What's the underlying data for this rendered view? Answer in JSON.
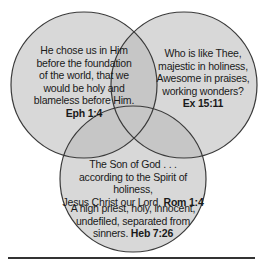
{
  "diagram": {
    "type": "venn",
    "circles": [
      {
        "id": "left",
        "lines": [
          "He chose us in Him",
          "before the foundation",
          "of the world, that we",
          "would be holy and",
          "blameless before Him."
        ],
        "reference": "Eph 1:4"
      },
      {
        "id": "right",
        "lines": [
          "Who is like Thee,",
          "majestic in holiness,",
          "Awesome in praises,",
          "working wonders?"
        ],
        "reference": "Ex 15:11"
      },
      {
        "id": "bottom",
        "passages": [
          {
            "lines": [
              "The Son of God . . .",
              "according to the Spirit of holiness,",
              "Jesus Christ our Lord."
            ],
            "reference": "Rom 1:4"
          },
          {
            "lines": [
              "A high priest, holy, innocent,",
              "undefiled, separated from",
              "sinners."
            ],
            "reference": "Heb 7:26"
          }
        ]
      }
    ],
    "colors": {
      "fill": "#d6d6d6",
      "overlap_fill": "#c2c2c2",
      "stroke": "#3a3a3a",
      "text": "#1a1a1a",
      "divider": "#333333"
    }
  }
}
